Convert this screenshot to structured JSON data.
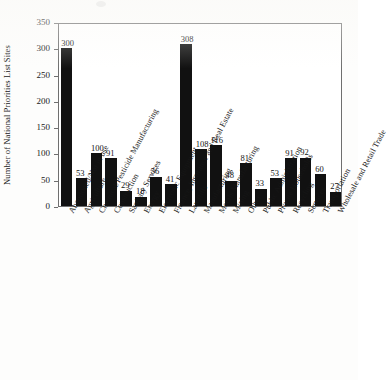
{
  "chart_data": {
    "type": "bar",
    "title": "",
    "xlabel": "",
    "ylabel": "Number of National Priorities List Sites",
    "ylim": [
      0,
      350
    ],
    "yticks": [
      0,
      50,
      100,
      150,
      200,
      250,
      300,
      350
    ],
    "grid": false,
    "legend": null,
    "bar_color": "#111111",
    "axis_color": "#6f6f6f",
    "categories": [
      "Abandoned/Not in use",
      "Agriculture",
      "Chemical/Pesticide Manufacturing",
      "Construction",
      "Sanitary Services",
      "Energy",
      "Electronic Equipment",
      "Finance, Insurance and Real Estate",
      "Landfills",
      "Manufacturing",
      "Metals Manufacturing",
      "Mining",
      "Other",
      "Public Administration",
      "Private Households",
      "Recycling",
      "Services",
      "Transportation",
      "Wholesale and Retail Trade"
    ],
    "values": [
      300,
      53,
      100,
      91,
      29,
      18,
      56,
      41,
      308,
      108,
      116,
      48,
      81,
      33,
      53,
      91,
      92,
      60,
      27
    ],
    "value_labels": [
      "300",
      "53",
      "100",
      "91",
      "29",
      "18",
      "56",
      "41",
      "308",
      "108",
      "116",
      "48",
      "81",
      "33",
      "53",
      "91",
      "92",
      "60",
      "27"
    ]
  }
}
